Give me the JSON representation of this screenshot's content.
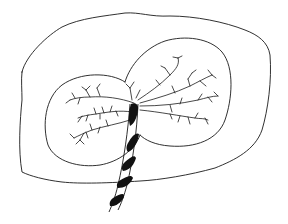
{
  "image": {
    "description": "Pen line drawing of a two-lobed placenta inside an outer membrane outline with branching vessels and a spiral-banded umbilical cord",
    "background": "#ffffff",
    "stroke_color": "#1a1a1a",
    "elements": {
      "outer_outline": "irregular membrane outline",
      "left_lobe": "left placental lobe",
      "right_lobe": "right placental lobe",
      "vessels": "branching blood vessels",
      "cord": "umbilical cord with black spiral bands"
    }
  }
}
